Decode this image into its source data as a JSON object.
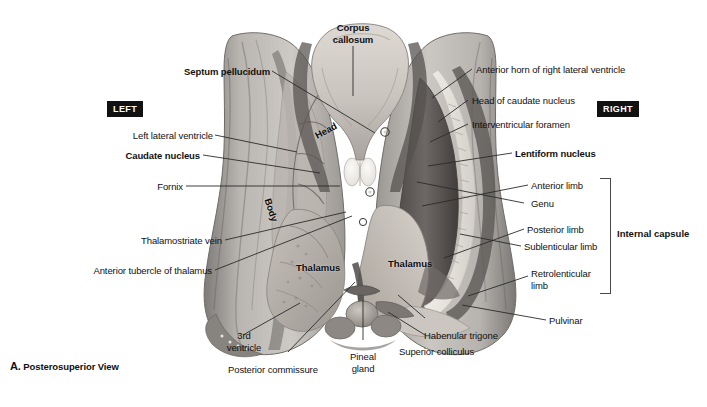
{
  "figure": {
    "caption_letter": "A.",
    "caption_text": " Posterosuperior View",
    "side_left": "LEFT",
    "side_right": "RIGHT"
  },
  "top_label": {
    "line1": "Corpus",
    "line2": "callosum"
  },
  "labels_left": [
    {
      "id": "septum-pellucidum",
      "text": "Septum pellucidum",
      "bold": true
    },
    {
      "id": "left-lateral-ventricle",
      "text": "Left lateral ventricle",
      "bold": false
    },
    {
      "id": "caudate-nucleus",
      "text": "Caudate nucleus",
      "bold": true
    },
    {
      "id": "fornix",
      "text": "Fornix",
      "bold": false
    },
    {
      "id": "thalamostriate-vein",
      "text": "Thalamostriate vein",
      "bold": false
    },
    {
      "id": "anterior-tubercle-thalamus",
      "text": "Anterior tubercle of thalamus",
      "bold": false
    }
  ],
  "labels_right": [
    {
      "id": "anterior-horn-right-lateral-ventricle",
      "text": "Anterior horn of right lateral ventricle",
      "bold": false
    },
    {
      "id": "head-of-caudate-nucleus",
      "text": "Head of caudate nucleus",
      "bold": false
    },
    {
      "id": "interventricular-foramen",
      "text": "Interventricular foramen",
      "bold": false
    },
    {
      "id": "lentiform-nucleus",
      "text": "Lentiform nucleus",
      "bold": true
    },
    {
      "id": "anterior-limb",
      "text": "Anterior limb",
      "bold": false
    },
    {
      "id": "genu",
      "text": "Genu",
      "bold": false
    },
    {
      "id": "posterior-limb",
      "text": "Posterior limb",
      "bold": false
    },
    {
      "id": "sublenticular-limb",
      "text": "Sublenticular limb",
      "bold": false
    },
    {
      "id": "retrolenticular-limb-1",
      "text": "Retrolenticular",
      "bold": false
    },
    {
      "id": "retrolenticular-limb-2",
      "text": "limb",
      "bold": false
    },
    {
      "id": "pulvinar",
      "text": "Pulvinar",
      "bold": false
    }
  ],
  "labels_bottom": [
    {
      "id": "third-ventricle-1",
      "text": "3rd",
      "bold": false
    },
    {
      "id": "third-ventricle-2",
      "text": "ventricle",
      "bold": false
    },
    {
      "id": "posterior-commissure",
      "text": "Posterior commissure",
      "bold": false
    },
    {
      "id": "pineal-gland-1",
      "text": "Pineal",
      "bold": false
    },
    {
      "id": "pineal-gland-2",
      "text": "gland",
      "bold": false
    },
    {
      "id": "superior-colliculus",
      "text": "Superior colliculus",
      "bold": false
    },
    {
      "id": "habenular-trigone",
      "text": "Habenular trigone",
      "bold": false
    }
  ],
  "bracket": {
    "label": "Internal capsule"
  },
  "labels_on_specimen": [
    {
      "id": "head",
      "text": "Head"
    },
    {
      "id": "body",
      "text": "Body"
    },
    {
      "id": "thalamus-left",
      "text": "Thalamus"
    },
    {
      "id": "thalamus-right",
      "text": "Thalamus"
    }
  ],
  "colors": {
    "ink": "#111111",
    "leader": "#2b2b2b",
    "badge_bg": "#111111",
    "badge_fg": "#ffffff",
    "bracket": "#4a4a4a",
    "page_bg": "#ffffff"
  }
}
